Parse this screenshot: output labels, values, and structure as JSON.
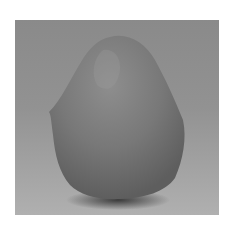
{
  "image": {
    "subject": "rounded gray clay-like stone form on gray backdrop",
    "colors": {
      "page_background": "#ffffff",
      "backdrop_top": "#8a8a8a",
      "backdrop_bottom": "#b0b0b0",
      "object_base": "#777777",
      "object_highlight": "#8e8e8e",
      "shadow": "#3a3a3a"
    }
  }
}
